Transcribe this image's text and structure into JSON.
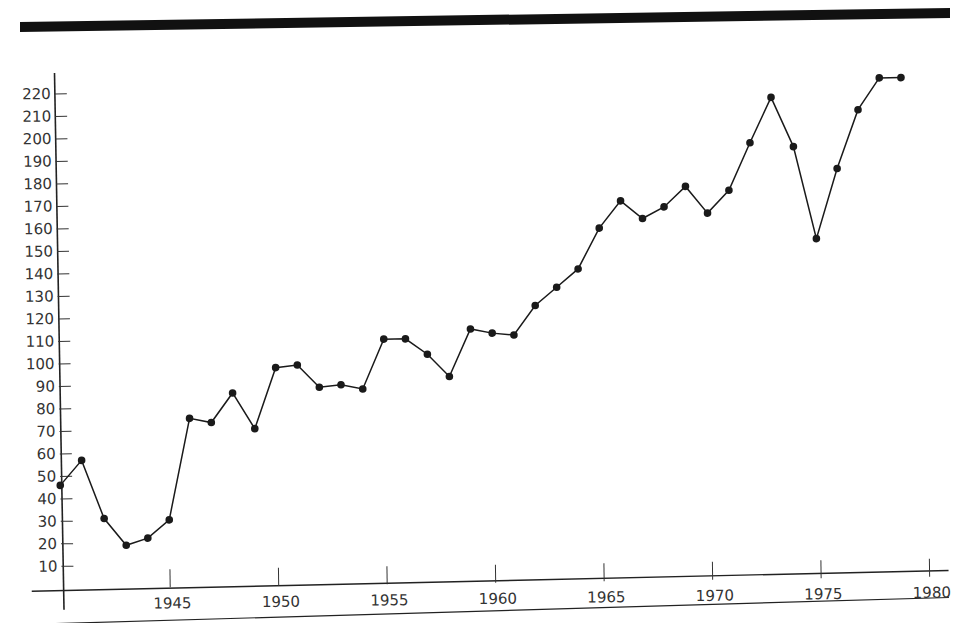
{
  "chart_data": {
    "type": "line",
    "title": "",
    "xlabel": "",
    "ylabel": "",
    "x": [
      1940,
      1941,
      1942,
      1943,
      1944,
      1945,
      1946,
      1947,
      1948,
      1949,
      1950,
      1951,
      1952,
      1953,
      1954,
      1955,
      1956,
      1957,
      1958,
      1959,
      1960,
      1961,
      1962,
      1963,
      1964,
      1965,
      1966,
      1967,
      1968,
      1969,
      1970,
      1971,
      1972,
      1973,
      1974,
      1975,
      1976,
      1977,
      1978,
      1979
    ],
    "series": [
      {
        "name": "",
        "values": [
          46,
          57,
          31,
          19,
          22,
          30,
          75,
          73,
          86,
          70,
          97,
          98,
          88,
          89,
          87,
          109,
          109,
          102,
          92,
          113,
          111,
          110,
          123,
          131,
          139,
          157,
          169,
          161,
          166,
          175,
          163,
          173,
          194,
          214,
          192,
          151,
          182,
          208,
          222,
          222
        ]
      }
    ],
    "x_ticks": [
      "1945",
      "1950",
      "1955",
      "1960",
      "1965",
      "1970",
      "1975",
      "1980"
    ],
    "y_ticks": [
      "10",
      "20",
      "30",
      "40",
      "50",
      "60",
      "70",
      "80",
      "90",
      "100",
      "110",
      "120",
      "130",
      "140",
      "150",
      "160",
      "170",
      "180",
      "190",
      "200",
      "210",
      "220"
    ],
    "xlim": [
      1940,
      1980
    ],
    "ylim": [
      0,
      225
    ],
    "grid": false,
    "legend": "none",
    "markers": "filled-circle",
    "color": "#1a1a1a"
  }
}
